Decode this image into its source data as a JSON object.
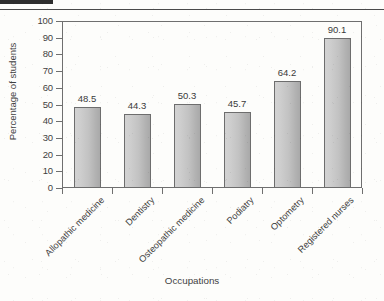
{
  "page": {
    "corner_mark": "",
    "top_rule": ""
  },
  "chart_data": {
    "type": "bar",
    "title": "",
    "xlabel": "Occupations",
    "ylabel": "Percentage of students",
    "categories": [
      "Allopathic medicine",
      "Dentistry",
      "Osteopathic medicine",
      "Podiatry",
      "Optometry",
      "Registered nurses"
    ],
    "values": [
      48.5,
      44.3,
      50.3,
      45.7,
      64.2,
      90.1
    ],
    "value_labels": [
      "48.5",
      "44.3",
      "50.3",
      "45.7",
      "64.2",
      "90.1"
    ],
    "ylim": [
      0,
      100
    ],
    "ytick_labels": [
      "0",
      "10",
      "20",
      "30",
      "40",
      "50",
      "60",
      "70",
      "80",
      "90",
      "100"
    ],
    "ytick_values": [
      0,
      10,
      20,
      30,
      40,
      50,
      60,
      70,
      80,
      90,
      100
    ],
    "grid": false,
    "legend": false,
    "bar_color": "#c2c2c2",
    "bar_border_color": "#6d6d6d",
    "axis_color": "#6f6f6f",
    "text_color": "#3f3f3f"
  }
}
